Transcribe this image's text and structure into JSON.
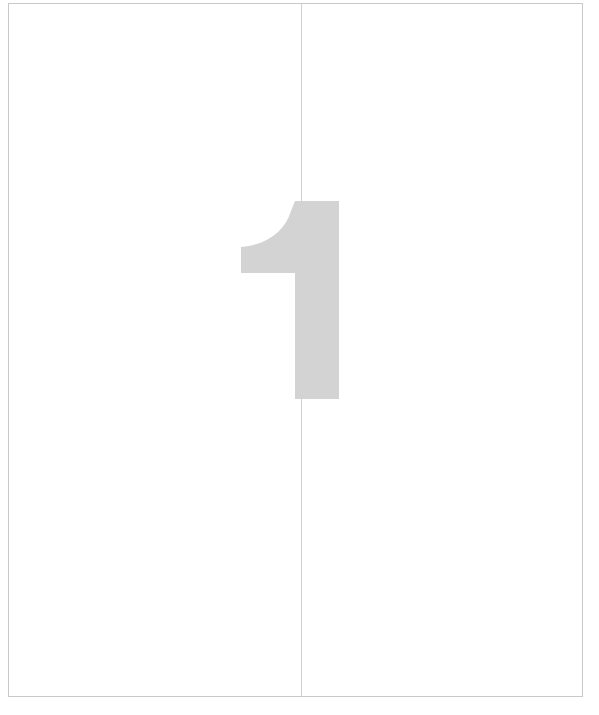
{
  "document": {
    "page_label": "1",
    "body_text": "",
    "background_color": "#ffffff",
    "border_color": "#c9c9c9"
  },
  "gutter": {
    "name": "vertical-fold-line",
    "color": "#cfcfcf"
  },
  "page_number_glyph": {
    "value": "1",
    "color": "#d3d3d3"
  }
}
